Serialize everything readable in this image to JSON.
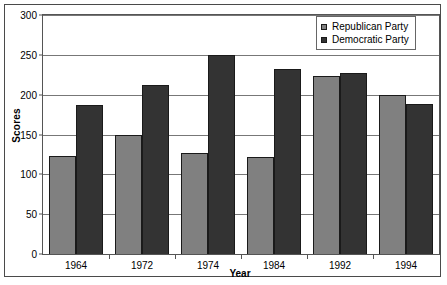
{
  "chart_data": {
    "type": "bar",
    "title": "",
    "xlabel": "Year",
    "ylabel": "Scores",
    "categories": [
      "1964",
      "1972",
      "1974",
      "1984",
      "1992",
      "1994"
    ],
    "series": [
      {
        "name": "Republican Party",
        "color": "#808080",
        "values": [
          123,
          150,
          127,
          122,
          223,
          200
        ]
      },
      {
        "name": "Democratic Party",
        "color": "#333333",
        "values": [
          187,
          212,
          250,
          232,
          227,
          188
        ]
      }
    ],
    "ylim": [
      0,
      300
    ],
    "yticks": [
      0,
      50,
      100,
      150,
      200,
      250,
      300
    ],
    "ytick_labels": [
      "0",
      "50",
      "100",
      "150",
      "200",
      "250",
      "300"
    ],
    "grid": true,
    "legend_position": "top-right",
    "legend_entries": [
      "Republican Party",
      "Democratic Party"
    ]
  }
}
